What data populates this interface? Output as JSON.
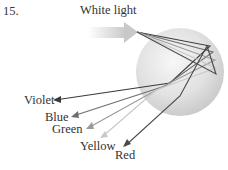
{
  "problem_number": "15.",
  "title": "White light",
  "labels": {
    "violet": "Violet",
    "blue": "Blue",
    "green": "Green",
    "yellow": "Yellow",
    "red": "Red"
  },
  "colors": {
    "violet": "#3a3a3a",
    "blue": "#6e6e6e",
    "green": "#9a9a9a",
    "yellow": "#c8c8c8",
    "red": "#4a4a4a",
    "sphere": "#e4e4e4",
    "incoming_arrow": "#d2d2d2"
  }
}
